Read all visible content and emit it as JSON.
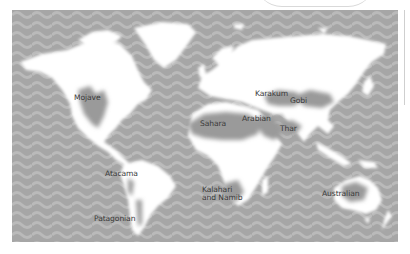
{
  "map": {
    "title": "",
    "theme": {
      "ocean": "#a6a6a6",
      "ocean_wave": "#b9b9b9",
      "land": "#ffffff",
      "desert": "#9a9a9a",
      "label": "#3a3a3a"
    },
    "deserts": [
      {
        "id": "mojave",
        "label": "Mojave"
      },
      {
        "id": "sahara",
        "label": "Sahara"
      },
      {
        "id": "arabian",
        "label": "Arabian"
      },
      {
        "id": "karakum",
        "label": "Karakum"
      },
      {
        "id": "gobi",
        "label": "Gobi"
      },
      {
        "id": "thar",
        "label": "Thar"
      },
      {
        "id": "atacama",
        "label": "Atacama"
      },
      {
        "id": "patagonian",
        "label": "Patagonian"
      },
      {
        "id": "kalahari",
        "label": "Kalahari\nand Namib",
        "line1": "Kalahari",
        "line2": "and Namib"
      },
      {
        "id": "australian",
        "label": "Australian"
      }
    ]
  }
}
